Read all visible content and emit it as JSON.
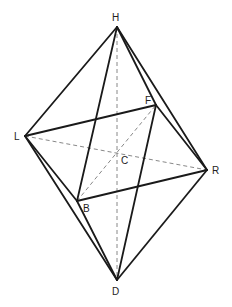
{
  "diagram": {
    "vertices": [
      {
        "id": "H",
        "label": "H"
      },
      {
        "id": "L",
        "label": "L"
      },
      {
        "id": "F",
        "label": "F"
      },
      {
        "id": "R",
        "label": "R"
      },
      {
        "id": "B",
        "label": "B"
      },
      {
        "id": "D",
        "label": "D"
      },
      {
        "id": "C",
        "label": "C"
      }
    ],
    "solid_edges": [
      [
        "H",
        "L"
      ],
      [
        "H",
        "B"
      ],
      [
        "H",
        "F"
      ],
      [
        "H",
        "R"
      ],
      [
        "D",
        "L"
      ],
      [
        "D",
        "B"
      ],
      [
        "D",
        "F"
      ],
      [
        "D",
        "R"
      ],
      [
        "L",
        "F"
      ],
      [
        "L",
        "B"
      ],
      [
        "B",
        "R"
      ],
      [
        "F",
        "R"
      ]
    ],
    "hidden_edges": [
      [
        "H",
        "D"
      ],
      [
        "L",
        "R"
      ],
      [
        "B",
        "F"
      ]
    ],
    "colors": {
      "line": "#1a1a1a",
      "hidden": "#888888",
      "background": "#ffffff"
    }
  }
}
